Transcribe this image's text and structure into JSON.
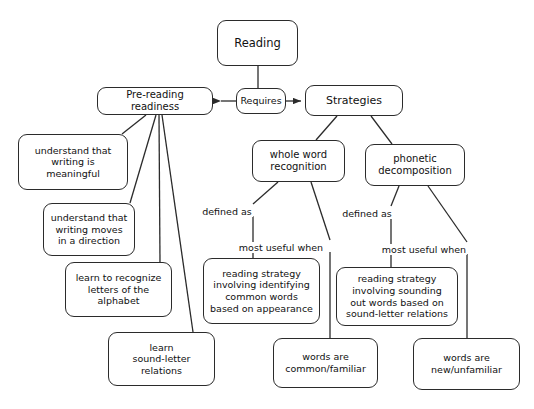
{
  "diagram": {
    "style": {
      "stroke": "#2b2b2b",
      "text_color": "#111111",
      "background": "#ffffff"
    },
    "nodes": [
      {
        "id": "reading",
        "label": "Reading",
        "x": 217,
        "y": 20,
        "w": 81,
        "h": 46,
        "font_size": 11.5
      },
      {
        "id": "requires",
        "label": "Requires",
        "x": 236,
        "y": 88,
        "w": 50,
        "h": 26,
        "font_size": 9.5
      },
      {
        "id": "pre-reading-readiness",
        "label": "Pre-reading readiness",
        "x": 97,
        "y": 87,
        "w": 116,
        "h": 28,
        "font_size": 10
      },
      {
        "id": "strategies",
        "label": "Strategies",
        "x": 305,
        "y": 85,
        "w": 98,
        "h": 31,
        "font_size": 11
      },
      {
        "id": "understand-meaningful",
        "label": "understand that\nwriting is\nmeaningful",
        "x": 18,
        "y": 134,
        "w": 110,
        "h": 56,
        "font_size": 9.5
      },
      {
        "id": "understand-direction",
        "label": "understand that\nwriting moves\nin a direction",
        "x": 43,
        "y": 203,
        "w": 92,
        "h": 53,
        "font_size": 9.5
      },
      {
        "id": "learn-letters",
        "label": "learn to recognize\nletters of the\nalphabet",
        "x": 65,
        "y": 262,
        "w": 107,
        "h": 55,
        "font_size": 9.5
      },
      {
        "id": "learn-sound-letter",
        "label": "learn\nsound-letter\nrelations",
        "x": 108,
        "y": 332,
        "w": 107,
        "h": 54,
        "font_size": 9.5
      },
      {
        "id": "whole-word-recognition",
        "label": "whole word\nrecognition",
        "x": 252,
        "y": 140,
        "w": 93,
        "h": 42,
        "font_size": 10
      },
      {
        "id": "phonetic-decomposition",
        "label": "phonetic\ndecomposition",
        "x": 365,
        "y": 144,
        "w": 100,
        "h": 42,
        "font_size": 10
      },
      {
        "id": "reading-strategy-appearance",
        "label": "reading strategy\ninvolving identifying\ncommon words\nbased on appearance",
        "x": 203,
        "y": 258,
        "w": 117,
        "h": 66,
        "font_size": 9.5
      },
      {
        "id": "reading-strategy-sounding",
        "label": "reading strategy\ninvolving sounding\nout words based on\nsound-letter relations",
        "x": 336,
        "y": 267,
        "w": 122,
        "h": 59,
        "font_size": 9.5
      },
      {
        "id": "words-common",
        "label": "words are\ncommon/familiar",
        "x": 273,
        "y": 338,
        "w": 105,
        "h": 50,
        "font_size": 9.5
      },
      {
        "id": "words-new",
        "label": "words are\nnew/unfamiliar",
        "x": 413,
        "y": 338,
        "w": 107,
        "h": 52,
        "font_size": 9.5
      }
    ],
    "edge_labels": [
      {
        "id": "defined-as-left",
        "label": "defined as",
        "x": 227,
        "y": 206,
        "font_size": 9.5
      },
      {
        "id": "most-useful-when-left",
        "label": "most useful when",
        "x": 281,
        "y": 242,
        "font_size": 9.5
      },
      {
        "id": "defined-as-right",
        "label": "defined as",
        "x": 367,
        "y": 208,
        "font_size": 9.5
      },
      {
        "id": "most-useful-when-right",
        "label": "most useful when",
        "x": 424,
        "y": 244,
        "font_size": 9.5
      }
    ],
    "edges": [
      {
        "id": "reading-to-requires",
        "from": "reading",
        "to": "requires",
        "path": "M 258 66 L 258 88"
      },
      {
        "id": "requires-to-pre-reading",
        "from": "requires",
        "to": "pre-reading-readiness",
        "arrow": "left",
        "path": "M 236 101 L 221 101"
      },
      {
        "id": "requires-to-strategies",
        "from": "requires",
        "to": "strategies",
        "arrow": "right",
        "path": "M 286 101 L 301 101"
      },
      {
        "id": "pre-reading-to-meaningful",
        "from": "pre-reading-readiness",
        "to": "understand-meaningful",
        "path": "M 146 115 L 122 134"
      },
      {
        "id": "pre-reading-to-direction",
        "from": "pre-reading-readiness",
        "to": "understand-direction",
        "path": "M 156 115 L 130 203"
      },
      {
        "id": "pre-reading-to-letters",
        "from": "pre-reading-readiness",
        "to": "learn-letters",
        "path": "M 159 115 L 160 262"
      },
      {
        "id": "pre-reading-to-sound-letter",
        "from": "pre-reading-readiness",
        "to": "learn-sound-letter",
        "path": "M 162 115 L 193 332"
      },
      {
        "id": "strategies-to-whole-word",
        "from": "strategies",
        "to": "whole-word-recognition",
        "path": "M 337 116 L 316 140"
      },
      {
        "id": "strategies-to-phonetic",
        "from": "strategies",
        "to": "phonetic-decomposition",
        "path": "M 371 116 L 392 144"
      },
      {
        "id": "whole-word-to-defined",
        "from": "whole-word-recognition",
        "to": "defined-as-left",
        "path": "M 278 182 L 253 204"
      },
      {
        "id": "defined-left-to-strategy",
        "from": "defined-as-left",
        "to": "reading-strategy-appearance",
        "path": "M 253 216 L 253 258"
      },
      {
        "id": "whole-word-to-most-useful",
        "from": "whole-word-recognition",
        "to": "most-useful-when-left",
        "path": "M 311 182 L 330 240"
      },
      {
        "id": "most-useful-left-to-words",
        "from": "most-useful-when-left",
        "to": "words-common",
        "path": "M 330 252 L 330 338"
      },
      {
        "id": "phonetic-to-defined",
        "from": "phonetic-decomposition",
        "to": "defined-as-right",
        "path": "M 399 186 L 391 206"
      },
      {
        "id": "defined-right-to-strategy",
        "from": "defined-as-right",
        "to": "reading-strategy-sounding",
        "path": "M 391 218 L 391 267"
      },
      {
        "id": "phonetic-to-most-useful",
        "from": "phonetic-decomposition",
        "to": "most-useful-when-right",
        "path": "M 428 186 L 467 242"
      },
      {
        "id": "most-useful-right-to-words",
        "from": "most-useful-when-right",
        "to": "words-new",
        "path": "M 467 254 L 467 338"
      }
    ]
  }
}
